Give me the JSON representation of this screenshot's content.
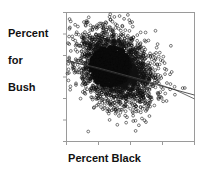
{
  "figure": {
    "ylabel_lines": [
      "Percent",
      "for",
      "Bush"
    ],
    "xlabel": "Percent Black",
    "frame_color": "#9a9a9a",
    "point_color": "#111111",
    "line_color": "#2b2b2b",
    "smooth_color": "#4a4a4a",
    "background": "#ffffff"
  },
  "chart_data": {
    "type": "scatter",
    "title": "",
    "xlabel": "Percent Black",
    "ylabel": "Percent for Bush",
    "xtick_labels": [],
    "ytick_labels": [],
    "n_xticks": 5,
    "n_yticks": 7,
    "grid": false,
    "legend": "none",
    "xlim": [
      0,
      100
    ],
    "ylim": [
      0,
      100
    ],
    "fit_line": {
      "name": "least-squares fit",
      "x": [
        0,
        100
      ],
      "y": [
        63,
        36
      ]
    },
    "smoother": {
      "name": "lowess smoother",
      "x": [
        0,
        12,
        25,
        40,
        55,
        70,
        85,
        100
      ],
      "y": [
        62,
        60,
        57,
        53,
        49,
        45,
        40,
        33
      ]
    },
    "series": [
      {
        "name": "counties",
        "n_points": 3000,
        "cloud_center": [
          34,
          58
        ],
        "cloud_spread_x": 14,
        "cloud_spread_y": 14,
        "marker": "open-circle",
        "marker_size": 1.4
      }
    ]
  }
}
